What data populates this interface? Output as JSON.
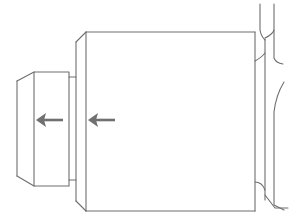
{
  "diagram": {
    "type": "mechanical-part-side-view",
    "colors": {
      "background": "#ffffff",
      "line": "#6e6e6e",
      "arrow": "#707070"
    },
    "parts": [
      {
        "name": "small-cap",
        "x": 17,
        "y": 72,
        "width": 52,
        "height": 114,
        "chamfered_left": true
      },
      {
        "name": "neck",
        "x": 69,
        "y": 77,
        "width": 8,
        "height": 103
      },
      {
        "name": "main-body",
        "x": 76,
        "y": 32,
        "width": 179,
        "height": 179,
        "chamfered_left": true
      },
      {
        "name": "right-mating-part",
        "x": 255,
        "y": 0,
        "width": 42,
        "height": 221
      }
    ],
    "arrows": [
      {
        "name": "arrow-left-1",
        "from": [
          63,
          120
        ],
        "to": [
          37,
          120
        ],
        "direction": "left"
      },
      {
        "name": "arrow-left-2",
        "from": [
          115,
          120
        ],
        "to": [
          88,
          120
        ],
        "direction": "left"
      }
    ]
  }
}
